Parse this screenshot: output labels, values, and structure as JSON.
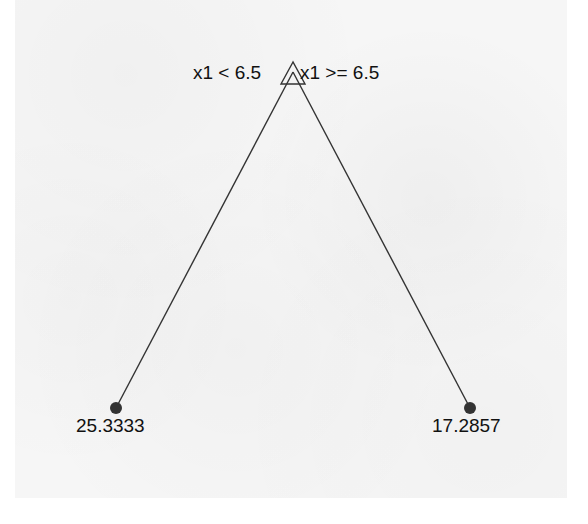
{
  "diagram": {
    "type": "decision-tree",
    "root": {
      "shape": "triangle",
      "left_condition": "x1 < 6.5",
      "right_condition": "x1 >= 6.5"
    },
    "leaves": [
      {
        "position": "left",
        "value": "25.3333"
      },
      {
        "position": "right",
        "value": "17.2857"
      }
    ],
    "colors": {
      "line": "#333333",
      "leaf_fill": "#333333",
      "text": "#111111",
      "background": "#f6f6f6"
    }
  }
}
